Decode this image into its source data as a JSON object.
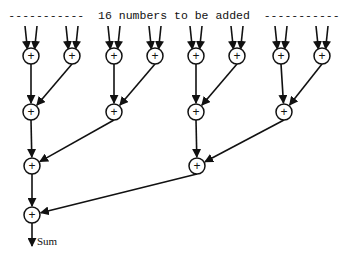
{
  "diagram": {
    "title": "-----------  16 numbers to be added  -----------",
    "output_label": "Sum",
    "node_symbol": "+",
    "colors": {
      "stroke": "#111111",
      "background": "#ffffff"
    },
    "levels": [
      {
        "y": 56,
        "nodes": [
          31,
          72,
          114,
          155,
          196,
          237,
          281,
          322
        ]
      },
      {
        "y": 112,
        "nodes": [
          31,
          114,
          196,
          284
        ]
      },
      {
        "y": 166,
        "nodes": [
          32,
          197
        ]
      },
      {
        "y": 215,
        "nodes": [
          32
        ]
      }
    ],
    "input_count": 16
  }
}
